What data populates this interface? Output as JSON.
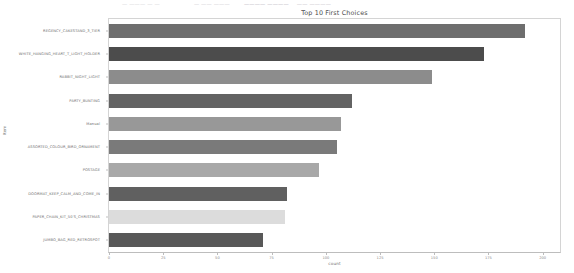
{
  "top_strip": {
    "seg1": "—  ———  — —",
    "seg2": "—  —— ———",
    "seg3": "————  ————",
    "seg4": "——  ————"
  },
  "chart_data": {
    "type": "bar",
    "orientation": "horizontal",
    "title": "Top 10 First Choices",
    "xlabel": "count",
    "ylabel": "Item",
    "xlim": [
      0,
      208
    ],
    "grid": false,
    "legend": null,
    "xticks": [
      0,
      25,
      50,
      75,
      100,
      125,
      150,
      175,
      200
    ],
    "xtick_labels": [
      "0",
      "25",
      "50",
      "75",
      "100",
      "125",
      "150",
      "175",
      "200"
    ],
    "categories": [
      "REGENCY_CAKESTAND_3_TIER",
      "WHITE_HANGING_HEART_T_LIGHT_HOLDER",
      "RABBIT_NIGHT_LIGHT",
      "PARTY_BUNTING",
      "Manual",
      "ASSORTED_COLOUR_BIRD_ORNAMENT",
      "POSTAGE",
      "DOORMAT_KEEP_CALM_AND_COME_IN",
      "PAPER_CHAIN_KIT_50'S_CHRISTMAS",
      "JUMBO_BAG_RED_RETROSPOT"
    ],
    "values": [
      192,
      173,
      149,
      112,
      107,
      105,
      97,
      82,
      81,
      71
    ],
    "bar_colors": [
      "#6e6e6e",
      "#4c4c4c",
      "#8c8c8c",
      "#636363",
      "#989898",
      "#7a7a7a",
      "#a8a8a8",
      "#606060",
      "#dcdcdc",
      "#585858"
    ]
  }
}
